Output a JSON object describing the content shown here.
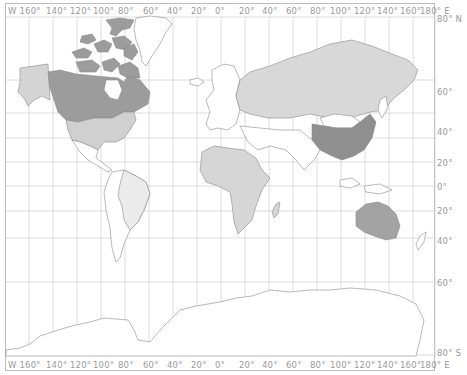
{
  "map": {
    "projection": "Mercator",
    "top_labels": [
      "W 160°",
      "140°",
      "120°",
      "100°",
      "80°",
      "60°",
      "40°",
      "20°",
      "0°",
      "20°",
      "40°",
      "60°",
      "80°",
      "100°",
      "120°",
      "140°",
      "160°",
      "180° E"
    ],
    "bottom_labels": [
      "W 160°",
      "140°",
      "120°",
      "100°",
      "80°",
      "60°",
      "40°",
      "20°",
      "0°",
      "20°",
      "40°",
      "60°",
      "80°",
      "100°",
      "120°",
      "140°",
      "160°",
      "180° E"
    ],
    "right_labels": [
      "80° N",
      "60°",
      "40°",
      "20°",
      "0°",
      "20°",
      "40°",
      "60°",
      "80° S"
    ],
    "highlighted_regions": [
      {
        "name": "Canada",
        "shade": "dark",
        "color": "#9c9c9c"
      },
      {
        "name": "China",
        "shade": "dark",
        "color": "#8f8f8f"
      },
      {
        "name": "Australia",
        "shade": "dark",
        "color": "#a3a3a3"
      },
      {
        "name": "Alaska",
        "shade": "light",
        "color": "#d4d4d4"
      },
      {
        "name": "United States",
        "shade": "light",
        "color": "#d0d0d0"
      },
      {
        "name": "Russia",
        "shade": "light",
        "color": "#d8d8d8"
      },
      {
        "name": "Africa",
        "shade": "light",
        "color": "#d6d6d6"
      },
      {
        "name": "Brazil",
        "shade": "lightest",
        "color": "#ebebeb"
      }
    ],
    "colors": {
      "grid": "#cfcfcf",
      "coast": "#8a8a8a",
      "label": "#9a9a9a",
      "frame": "#bdbdbd"
    }
  }
}
